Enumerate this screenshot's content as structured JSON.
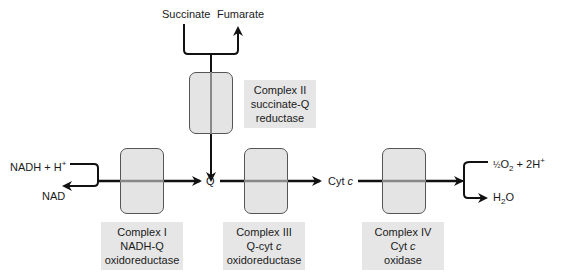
{
  "inputs": {
    "succinate": "Succinate",
    "fumarate": "Fumarate",
    "nadh": "NADH + H",
    "nadh_sup": "+",
    "nad": "NAD",
    "q": "Q",
    "cytc_prefix": "Cyt ",
    "cytc_italic": "c",
    "o2_half": "½",
    "o2_main": "O",
    "o2_sub": "2",
    "o2_rest": " + 2H",
    "o2_sup": "+",
    "h2o_h": "H",
    "h2o_sub": "2",
    "h2o_o": "O"
  },
  "complexes": [
    {
      "name": "Complex I",
      "line2": "NADH-Q",
      "line3": "oxidoreductase"
    },
    {
      "name": "Complex II",
      "line2": "succinate-Q",
      "line3": "reductase"
    },
    {
      "name": "Complex III",
      "line2a": "Q-cyt ",
      "line2b": "c",
      "line3": "oxidoreductase"
    },
    {
      "name": "Complex IV",
      "line2a": "Cyt ",
      "line2b": "c",
      "line3": "oxidase"
    }
  ],
  "colors": {
    "box_fill": "#e6e6e6",
    "complex_fill": "#e4e4e4",
    "line": "#111111"
  }
}
